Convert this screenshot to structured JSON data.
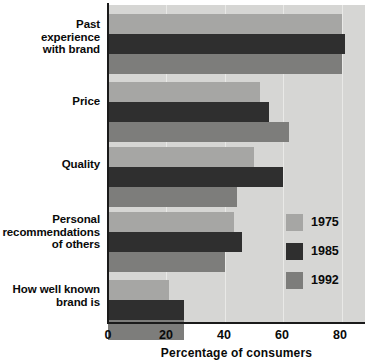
{
  "chart_data": {
    "type": "bar",
    "orientation": "horizontal",
    "title": "",
    "xlabel": "Percentage of consumers",
    "ylabel": "",
    "xlim": [
      0,
      88
    ],
    "xticks": [
      0,
      20,
      40,
      60,
      80
    ],
    "xtick_labels": [
      "0",
      "20",
      "40",
      "60",
      "80"
    ],
    "grid": true,
    "legend_position": "center-right",
    "categories": [
      "Past\nexperience\nwith brand",
      "Price",
      "Quality",
      "Personal\nrecommendations\nof others",
      "How well known\nbrand is"
    ],
    "series": [
      {
        "name": "1975",
        "color": "#a6a6a4",
        "values": [
          80,
          52,
          50,
          43,
          21
        ]
      },
      {
        "name": "1985",
        "color": "#2f2f2f",
        "values": [
          81,
          55,
          60,
          46,
          26
        ]
      },
      {
        "name": "1992",
        "color": "#7d7d7b",
        "values": [
          80,
          62,
          44,
          40,
          26
        ]
      }
    ]
  },
  "legend": {
    "items": [
      {
        "label": "1975",
        "color": "#a6a6a4"
      },
      {
        "label": "1985",
        "color": "#2f2f2f"
      },
      {
        "label": "1992",
        "color": "#7d7d7b"
      }
    ]
  },
  "axis": {
    "x_title": "Percentage of consumers",
    "tick_0": "0",
    "tick_20": "20",
    "tick_40": "40",
    "tick_60": "60",
    "tick_80": "80"
  },
  "categories_display": {
    "cat0": "Past\nexperience\nwith brand",
    "cat1": "Price",
    "cat2": "Quality",
    "cat3": "Personal\nrecommendations\nof others",
    "cat4": "How well known\nbrand is"
  },
  "colors": {
    "plot_background": "#d6d6d4",
    "axis": "#1a1a1a",
    "text": "#0a0a0a",
    "gridline": "#e9e9e7"
  }
}
